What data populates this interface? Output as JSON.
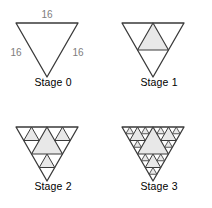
{
  "figure": {
    "type": "sierpinski-triangle-sequence",
    "background_color": "#ffffff",
    "stroke_color": "#3a3a3a",
    "fill_color": "#e8e8e8",
    "label_color": "#7d7d7d",
    "caption_color": "#000000",
    "orientation": "downward-pointing"
  },
  "stages": [
    {
      "caption": "Stage 0",
      "depth": 0,
      "shaded_count": 0,
      "labels": {
        "top": "16",
        "left": "16",
        "right": "16"
      }
    },
    {
      "caption": "Stage 1",
      "depth": 1,
      "shaded_count": 1,
      "labels": {}
    },
    {
      "caption": "Stage 2",
      "depth": 2,
      "shaded_count": 4,
      "labels": {}
    },
    {
      "caption": "Stage 3",
      "depth": 3,
      "shaded_count": 13,
      "labels": {}
    }
  ]
}
